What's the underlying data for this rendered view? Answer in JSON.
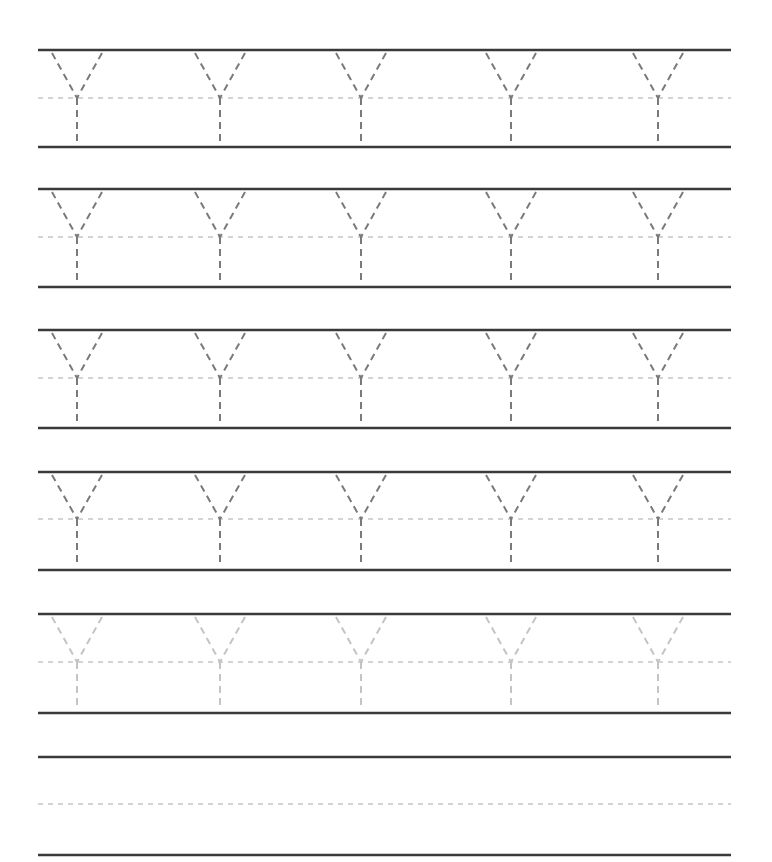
{
  "worksheet": {
    "letter": "Y",
    "colors": {
      "solid_line": "#3a3a3a",
      "guide_line": "#a8a8a8",
      "trace_dark": "#7a7a7a",
      "trace_light": "#c4c4c4"
    },
    "line_x_start": 38,
    "line_x_end": 731,
    "letter_centers_x": [
      77,
      220,
      361,
      511,
      658
    ],
    "rows": [
      {
        "top": 50,
        "mid": 98,
        "bottom": 147,
        "letters": 5,
        "shade": "dark"
      },
      {
        "top": 189,
        "mid": 237,
        "bottom": 287,
        "letters": 5,
        "shade": "dark"
      },
      {
        "top": 330,
        "mid": 378,
        "bottom": 428,
        "letters": 5,
        "shade": "dark"
      },
      {
        "top": 472,
        "mid": 519,
        "bottom": 570,
        "letters": 5,
        "shade": "dark"
      },
      {
        "top": 614,
        "mid": 662,
        "bottom": 713,
        "letters": 5,
        "shade": "light"
      },
      {
        "top": 757,
        "mid": 804,
        "bottom": 855,
        "letters": 0,
        "shade": "none"
      }
    ]
  }
}
